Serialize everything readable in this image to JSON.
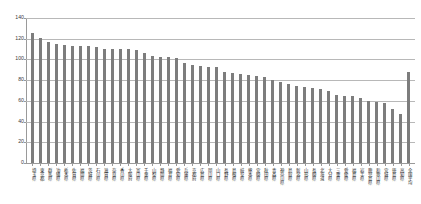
{
  "chart_data": {
    "type": "bar",
    "title": "",
    "subtitle": "",
    "xlabel": "",
    "ylabel": "",
    "ylim": [
      0,
      140
    ],
    "yticks": [
      0,
      20,
      40,
      60,
      80,
      100,
      120,
      140
    ],
    "grid": true,
    "legend": null,
    "series_name": "",
    "bar_color": "#7d7d7d",
    "categories": [
      "埼玉県",
      "東京都",
      "群馬県",
      "沖縄県",
      "栃木県",
      "佐賀県",
      "福岡県",
      "茨城県",
      "石川県",
      "滋賀県",
      "奈良県",
      "香川県",
      "大阪府",
      "富山県",
      "千葉県",
      "山梨県",
      "静岡県",
      "福井県",
      "愛知県",
      "兵庫県",
      "京都府",
      "広島県",
      "岡山県",
      "山口県",
      "長野県",
      "島根県",
      "岐阜県",
      "熊本県",
      "宮崎県",
      "秋田県",
      "青森県",
      "神奈川県",
      "鳥取県",
      "新潟県",
      "山形県",
      "長崎県",
      "北海道",
      "大分県",
      "三重県",
      "愛媛県",
      "福島県",
      "岩手県",
      "鹿児島県",
      "和歌山県",
      "宮城県",
      "徳島県",
      "高知県",
      "全国平均"
    ],
    "values": [
      126,
      121,
      117,
      115,
      114,
      113,
      113,
      113,
      112,
      110,
      110,
      110,
      110,
      109,
      106,
      103,
      102,
      102,
      101,
      97,
      95,
      94,
      93,
      93,
      88,
      87,
      86,
      85,
      84,
      83,
      80,
      78,
      76,
      74,
      73,
      72,
      71,
      70,
      66,
      65,
      65,
      63,
      60,
      59,
      58,
      52,
      47,
      88
    ],
    "highlight_index": 47,
    "highlight_label": "全国平均"
  }
}
